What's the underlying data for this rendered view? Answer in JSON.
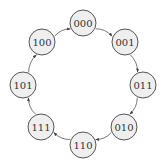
{
  "diagram": {
    "type": "state-cycle",
    "nodes": [
      {
        "id": "000",
        "label": "000",
        "x": 83,
        "y": 23
      },
      {
        "id": "001",
        "label": "001",
        "x": 125,
        "y": 42
      },
      {
        "id": "011",
        "label": "011",
        "x": 143,
        "y": 85
      },
      {
        "id": "010",
        "label": "010",
        "x": 124,
        "y": 127
      },
      {
        "id": "110",
        "label": "110",
        "x": 83,
        "y": 145
      },
      {
        "id": "111",
        "label": "111",
        "x": 41,
        "y": 127
      },
      {
        "id": "101",
        "label": "101",
        "x": 23,
        "y": 85
      },
      {
        "id": "100",
        "label": "100",
        "x": 42,
        "y": 42
      }
    ],
    "edges": [
      {
        "from": "000",
        "to": "001"
      },
      {
        "from": "001",
        "to": "011"
      },
      {
        "from": "011",
        "to": "010"
      },
      {
        "from": "010",
        "to": "110"
      },
      {
        "from": "110",
        "to": "111"
      },
      {
        "from": "111",
        "to": "101"
      },
      {
        "from": "101",
        "to": "100"
      },
      {
        "from": "100",
        "to": "000"
      }
    ],
    "node_radius": 13,
    "colors": {
      "node_fill": "#efefef",
      "node_stroke": "#555555",
      "edge": "#555555",
      "text": "#333333"
    }
  }
}
